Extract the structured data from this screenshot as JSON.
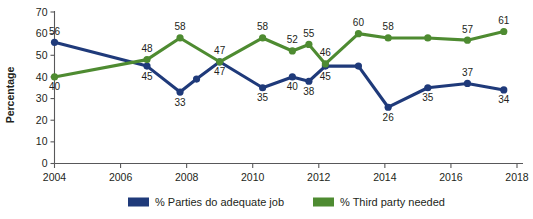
{
  "chart_data": {
    "type": "line",
    "title": "",
    "xlabel": "",
    "ylabel": "Percentage",
    "xlim": [
      2004,
      2018
    ],
    "ylim": [
      0,
      70
    ],
    "ytick_step": 10,
    "xtick_step": 2,
    "grid": false,
    "legend_position": "bottom",
    "xticks": [
      "2004",
      "2006",
      "2008",
      "2010",
      "2012",
      "2014",
      "2016",
      "2018"
    ],
    "yticks": [
      "0",
      "10",
      "20",
      "30",
      "40",
      "50",
      "60",
      "70"
    ],
    "series": [
      {
        "name": "% Parties do adequate job",
        "color": "#1F3A7A",
        "x": [
          2004,
          2006.8,
          2007.8,
          2008.3,
          2009,
          2010.3,
          2011.2,
          2011.7,
          2012.2,
          2013.2,
          2014.1,
          2015.3,
          2016.5,
          2017.6
        ],
        "values": [
          56,
          45,
          33,
          39,
          47,
          35,
          40,
          38,
          45,
          45,
          26,
          35,
          37,
          34
        ],
        "labels": [
          "56",
          "45",
          "33",
          "",
          "47",
          "35",
          "40",
          "38",
          "45",
          "",
          "26",
          "35",
          "37",
          "34"
        ],
        "label_pos": [
          "above",
          "below",
          "below",
          "none",
          "below",
          "below",
          "below",
          "below",
          "below",
          "none",
          "below",
          "below",
          "above",
          "below"
        ]
      },
      {
        "name": "% Third party needed",
        "color": "#4E8B31",
        "x": [
          2004,
          2006.8,
          2007.8,
          2009,
          2010.3,
          2011.2,
          2011.7,
          2012.2,
          2013.2,
          2014.1,
          2015.3,
          2016.5,
          2017.6
        ],
        "values": [
          40,
          48,
          58,
          47,
          58,
          52,
          55,
          46,
          60,
          58,
          58,
          57,
          61
        ],
        "labels": [
          "40",
          "48",
          "58",
          "47",
          "58",
          "52",
          "55",
          "46",
          "60",
          "58",
          "",
          "57",
          "61"
        ],
        "label_pos": [
          "below",
          "above",
          "above",
          "above",
          "above",
          "above",
          "above",
          "above",
          "above",
          "above",
          "none",
          "above",
          "above"
        ]
      }
    ]
  },
  "legend": {
    "items": [
      {
        "label": "% Parties do adequate job",
        "color": "#1F3A7A"
      },
      {
        "label": "% Third party needed",
        "color": "#4E8B31"
      }
    ]
  },
  "axis": {
    "y_title": "Percentage"
  }
}
